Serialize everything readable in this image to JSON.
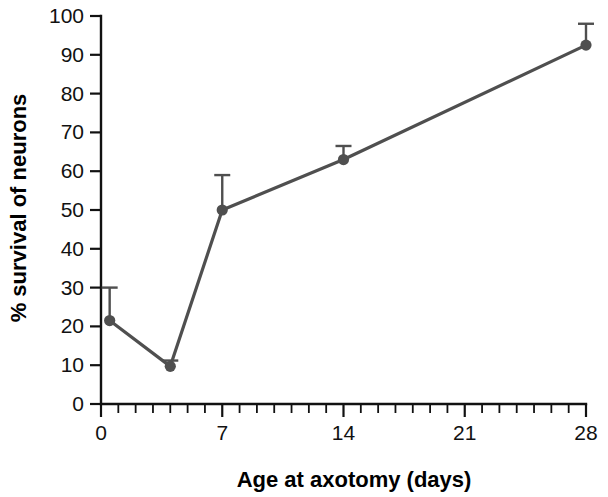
{
  "chart_data": {
    "type": "line",
    "title": "",
    "xlabel": "Age at axotomy (days)",
    "ylabel": "% survival of neurons",
    "xlim": [
      0,
      28
    ],
    "ylim": [
      0,
      100
    ],
    "xticks": [
      0,
      7,
      14,
      21,
      28
    ],
    "xtick_labels": [
      "0",
      "7",
      "14",
      "21",
      "28"
    ],
    "x_minor_tick_step": 1,
    "yticks": [
      0,
      10,
      20,
      30,
      40,
      50,
      60,
      70,
      80,
      90,
      100
    ],
    "ytick_labels": [
      "0",
      "10",
      "20",
      "30",
      "40",
      "50",
      "60",
      "70",
      "80",
      "90",
      "100"
    ],
    "grid": false,
    "legend": "none",
    "series": [
      {
        "name": "% survival of neurons",
        "color": "#4f4f4f",
        "marker": "circle",
        "x": [
          0.5,
          4,
          7,
          14,
          28
        ],
        "values": [
          21.5,
          9.7,
          50,
          63,
          92.5
        ],
        "error_upper": [
          8.5,
          1.5,
          9,
          3.5,
          5.5
        ],
        "error_lower": [
          0,
          0,
          0,
          0,
          0
        ]
      }
    ]
  },
  "axis": {
    "x_title": "Age at axotomy (days)",
    "y_title": "% survival of neurons"
  },
  "colors": {
    "series": "#4f4f4f",
    "axis": "#111111",
    "background": "#ffffff"
  }
}
